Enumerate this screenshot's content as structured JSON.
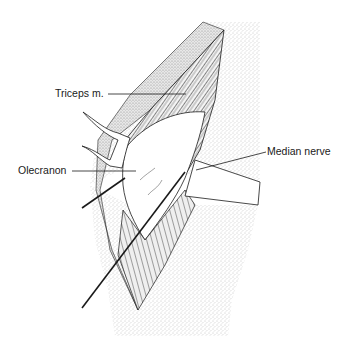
{
  "figure": {
    "labels": {
      "triceps": "Triceps m.",
      "olecranon": "Olecranon",
      "median_nerve": "Median nerve"
    },
    "caption_partial": "",
    "colors": {
      "ink": "#1a1a1a",
      "skin_stipple": "#9a9a9a",
      "background": "#ffffff"
    }
  }
}
